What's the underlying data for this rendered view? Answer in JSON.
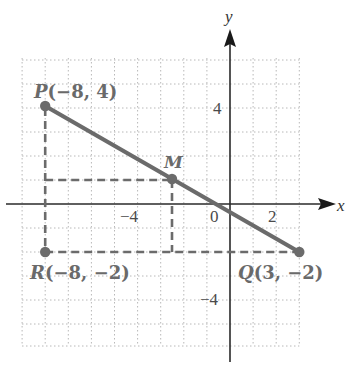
{
  "diagram": {
    "type": "coordinate-plane",
    "axes": {
      "x_label": "x",
      "y_label": "y",
      "grid": {
        "x_min": -9,
        "x_max": 3,
        "y_min": -6,
        "y_max": 6,
        "step": 1
      }
    },
    "tick_labels": {
      "x_neg4": "−4",
      "x_0": "0",
      "x_2": "2",
      "y_4": "4",
      "y_neg4": "−4"
    },
    "points": {
      "P": {
        "name": "P",
        "coords": "(−8, 4)",
        "x": -8,
        "y": 4
      },
      "M": {
        "name": "M",
        "coords": "",
        "x": -2.5,
        "y": 1
      },
      "R": {
        "name": "R",
        "coords": "(−8, −2)",
        "x": -8,
        "y": -2
      },
      "Q": {
        "name": "Q",
        "coords": "(3, −2)",
        "x": 3,
        "y": -2
      }
    },
    "segments": [
      {
        "from": "P",
        "to": "Q",
        "style": "solid"
      },
      {
        "from": "P",
        "to": "R",
        "style": "dashed"
      },
      {
        "from": "R",
        "to": "Q",
        "style": "dashed"
      }
    ],
    "colors": {
      "segment": "#6b6b6b",
      "point": "#6b6b6b",
      "axis": "#2a2a2a",
      "grid": "#b5b5b5"
    }
  }
}
